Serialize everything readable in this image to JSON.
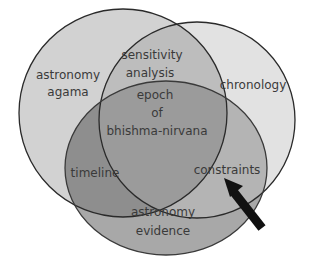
{
  "diagram": {
    "type": "venn",
    "sets": [
      {
        "label_lines": [
          "astronomy",
          "agama"
        ],
        "fill": "#c9c9c9"
      },
      {
        "label_lines": [
          "chronology"
        ],
        "fill": "#dedede"
      },
      {
        "label_lines": [
          "astronomy",
          "evidence"
        ],
        "fill": "#9e9e9e"
      }
    ],
    "intersections": {
      "agama_chronology": [
        "sensitivity",
        "analysis"
      ],
      "all_three": [
        "epoch",
        "of",
        "bhishma-nirvana"
      ],
      "agama_evidence": [
        "timeline"
      ],
      "chronology_evidence": [
        "constraints"
      ]
    },
    "arrow": {
      "points_to": "constraints",
      "color": "#111111"
    }
  }
}
